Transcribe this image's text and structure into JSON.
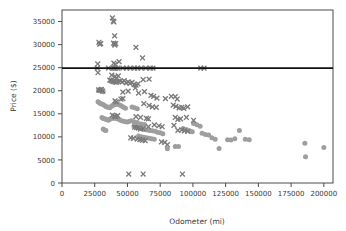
{
  "chart_data": {
    "type": "scatter",
    "title": "",
    "xlabel": "Odometer (mi)",
    "ylabel": "Price ($)",
    "xlim": [
      0,
      207000
    ],
    "ylim": [
      0,
      37500
    ],
    "xticks": [
      0,
      25000,
      50000,
      75000,
      100000,
      125000,
      150000,
      175000,
      200000
    ],
    "xticklabels": [
      "0",
      "25000",
      "50000",
      "75000",
      "100000",
      "125000",
      "150000",
      "175000",
      "200000"
    ],
    "yticks": [
      0,
      5000,
      10000,
      15000,
      20000,
      25000,
      30000,
      35000
    ],
    "yticklabels": [
      "0",
      "5000",
      "10000",
      "15000",
      "20000",
      "25000",
      "30000",
      "35000"
    ],
    "grid": false,
    "legend": null,
    "colors": {
      "cross_marker": "#7a7a7a",
      "circle_marker": "#9e9e9e",
      "reference_line": "#111111",
      "axis": "#4a4a4a",
      "background": "#ffffff"
    },
    "annotations": [
      {
        "kind": "horizontal-line",
        "y": 24900,
        "x_start": 0,
        "x_end": 207000,
        "color": "#111111",
        "label": "reference price line at 24900"
      }
    ],
    "series": [
      {
        "name": "cross-series",
        "marker": "x",
        "color": "#7a7a7a",
        "points": [
          [
            38500,
            35800
          ],
          [
            39200,
            35100
          ],
          [
            39600,
            34900
          ],
          [
            40200,
            31900
          ],
          [
            28200,
            30500
          ],
          [
            28800,
            30100
          ],
          [
            29600,
            30200
          ],
          [
            39400,
            30300
          ],
          [
            40100,
            30100
          ],
          [
            41000,
            30200
          ],
          [
            40400,
            29900
          ],
          [
            56500,
            29400
          ],
          [
            61500,
            27100
          ],
          [
            27300,
            25800
          ],
          [
            39600,
            26000
          ],
          [
            40700,
            25700
          ],
          [
            43600,
            26300
          ],
          [
            26900,
            24900
          ],
          [
            27500,
            23900
          ],
          [
            35500,
            24900
          ],
          [
            39000,
            24900
          ],
          [
            40000,
            24900
          ],
          [
            41000,
            24900
          ],
          [
            42500,
            24900
          ],
          [
            46500,
            24900
          ],
          [
            49500,
            24900
          ],
          [
            52000,
            24900
          ],
          [
            55500,
            24900
          ],
          [
            57500,
            24900
          ],
          [
            60500,
            24900
          ],
          [
            64000,
            24900
          ],
          [
            67500,
            24900
          ],
          [
            69500,
            24900
          ],
          [
            106000,
            24900
          ],
          [
            108500,
            24900
          ],
          [
            38000,
            23400
          ],
          [
            40500,
            23100
          ],
          [
            43000,
            23200
          ],
          [
            41500,
            22600
          ],
          [
            36500,
            22300
          ],
          [
            37500,
            22200
          ],
          [
            38500,
            22100
          ],
          [
            39500,
            22000
          ],
          [
            40500,
            21900
          ],
          [
            41500,
            21800
          ],
          [
            43000,
            22000
          ],
          [
            44500,
            22100
          ],
          [
            46000,
            21900
          ],
          [
            47500,
            22200
          ],
          [
            49000,
            21700
          ],
          [
            50500,
            21900
          ],
          [
            52000,
            21600
          ],
          [
            53500,
            21800
          ],
          [
            55000,
            21300
          ],
          [
            56500,
            21200
          ],
          [
            58000,
            21500
          ],
          [
            62000,
            22400
          ],
          [
            66500,
            22500
          ],
          [
            28000,
            20200
          ],
          [
            29000,
            20100
          ],
          [
            30000,
            20300
          ],
          [
            31000,
            19900
          ],
          [
            46500,
            19700
          ],
          [
            50500,
            19900
          ],
          [
            56000,
            20600
          ],
          [
            58500,
            19500
          ],
          [
            63000,
            19800
          ],
          [
            68000,
            19000
          ],
          [
            70000,
            18800
          ],
          [
            45000,
            18200
          ],
          [
            46500,
            18300
          ],
          [
            40500,
            17800
          ],
          [
            41500,
            17600
          ],
          [
            62500,
            17200
          ],
          [
            72500,
            18400
          ],
          [
            79000,
            18300
          ],
          [
            83500,
            18800
          ],
          [
            86500,
            18700
          ],
          [
            88000,
            18200
          ],
          [
            66500,
            16800
          ],
          [
            69000,
            16500
          ],
          [
            72000,
            16400
          ],
          [
            85000,
            16900
          ],
          [
            87000,
            16600
          ],
          [
            89500,
            16300
          ],
          [
            91500,
            16400
          ],
          [
            93000,
            16200
          ],
          [
            96000,
            16500
          ],
          [
            38500,
            14700
          ],
          [
            40000,
            14500
          ],
          [
            41000,
            14400
          ],
          [
            42500,
            14600
          ],
          [
            56500,
            14400
          ],
          [
            60000,
            14200
          ],
          [
            64500,
            14000
          ],
          [
            66000,
            13900
          ],
          [
            86500,
            14200
          ],
          [
            88500,
            13800
          ],
          [
            90500,
            13900
          ],
          [
            95000,
            14200
          ],
          [
            100500,
            13600
          ],
          [
            55500,
            12100
          ],
          [
            57000,
            12000
          ],
          [
            58500,
            11900
          ],
          [
            60000,
            11700
          ],
          [
            62000,
            11800
          ],
          [
            66000,
            12200
          ],
          [
            70500,
            12600
          ],
          [
            74000,
            12400
          ],
          [
            76500,
            12200
          ],
          [
            85500,
            12500
          ],
          [
            88500,
            11400
          ],
          [
            91500,
            11500
          ],
          [
            93500,
            11300
          ],
          [
            96000,
            11200
          ],
          [
            52500,
            9800
          ],
          [
            54500,
            9700
          ],
          [
            57500,
            9500
          ],
          [
            59500,
            9400
          ],
          [
            61500,
            9300
          ],
          [
            63500,
            9200
          ],
          [
            76000,
            8900
          ],
          [
            78500,
            8800
          ],
          [
            80500,
            8300
          ],
          [
            51000,
            1950
          ],
          [
            62000,
            1950
          ],
          [
            92000,
            1950
          ]
        ]
      },
      {
        "name": "circle-series",
        "marker": "o",
        "color": "#9e9e9e",
        "points": [
          [
            28000,
            20100
          ],
          [
            29200,
            20000
          ],
          [
            30400,
            20200
          ],
          [
            31500,
            19800
          ],
          [
            27500,
            17600
          ],
          [
            28500,
            17400
          ],
          [
            29500,
            17200
          ],
          [
            30500,
            17100
          ],
          [
            31500,
            17000
          ],
          [
            32500,
            16800
          ],
          [
            33500,
            16600
          ],
          [
            34500,
            16500
          ],
          [
            35500,
            16400
          ],
          [
            36500,
            16300
          ],
          [
            37500,
            16600
          ],
          [
            38500,
            16800
          ],
          [
            39500,
            16900
          ],
          [
            41000,
            17000
          ],
          [
            42500,
            17100
          ],
          [
            44000,
            16900
          ],
          [
            45500,
            16700
          ],
          [
            47000,
            16400
          ],
          [
            48500,
            16200
          ],
          [
            30500,
            14200
          ],
          [
            31500,
            14000
          ],
          [
            32500,
            13900
          ],
          [
            33500,
            13800
          ],
          [
            34500,
            13700
          ],
          [
            35500,
            13600
          ],
          [
            36500,
            13800
          ],
          [
            38000,
            14000
          ],
          [
            39500,
            14100
          ],
          [
            41000,
            14000
          ],
          [
            42500,
            13900
          ],
          [
            44000,
            13700
          ],
          [
            45500,
            13500
          ],
          [
            47000,
            13400
          ],
          [
            48500,
            13300
          ],
          [
            50000,
            13200
          ],
          [
            51500,
            13400
          ],
          [
            53000,
            13500
          ],
          [
            55000,
            13300
          ],
          [
            57500,
            13100
          ],
          [
            60500,
            12800
          ],
          [
            63000,
            12700
          ],
          [
            31500,
            11700
          ],
          [
            32500,
            11500
          ],
          [
            33500,
            11400
          ],
          [
            53500,
            16500
          ],
          [
            55500,
            16300
          ],
          [
            57500,
            16100
          ],
          [
            55000,
            12300
          ],
          [
            57000,
            12100
          ],
          [
            59000,
            12000
          ],
          [
            61000,
            11800
          ],
          [
            63000,
            11600
          ],
          [
            65000,
            11500
          ],
          [
            67000,
            11400
          ],
          [
            69000,
            11300
          ],
          [
            71000,
            11200
          ],
          [
            73000,
            11000
          ],
          [
            75000,
            10900
          ],
          [
            77000,
            10700
          ],
          [
            58500,
            10200
          ],
          [
            60500,
            10000
          ],
          [
            62500,
            9900
          ],
          [
            64500,
            9800
          ],
          [
            66500,
            9700
          ],
          [
            68500,
            9600
          ],
          [
            70500,
            9500
          ],
          [
            80500,
            7400
          ],
          [
            86500,
            7900
          ],
          [
            89000,
            7900
          ],
          [
            92500,
            11800
          ],
          [
            95000,
            11600
          ],
          [
            97500,
            11300
          ],
          [
            99500,
            11100
          ],
          [
            100500,
            12900
          ],
          [
            103000,
            12600
          ],
          [
            105500,
            12300
          ],
          [
            107000,
            10800
          ],
          [
            109500,
            10500
          ],
          [
            112000,
            10400
          ],
          [
            114500,
            9800
          ],
          [
            117000,
            9500
          ],
          [
            120000,
            7500
          ],
          [
            126500,
            9400
          ],
          [
            129000,
            9300
          ],
          [
            132000,
            9600
          ],
          [
            135500,
            11400
          ],
          [
            140000,
            9500
          ],
          [
            143000,
            9400
          ],
          [
            185500,
            8600
          ],
          [
            186000,
            5700
          ],
          [
            200000,
            7700
          ]
        ]
      }
    ]
  },
  "figure": {
    "plot_left": 62,
    "plot_top": 10,
    "plot_right": 333,
    "plot_bottom": 183
  }
}
